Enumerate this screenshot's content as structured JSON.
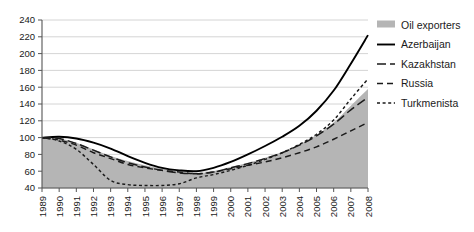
{
  "chart_data": {
    "type": "line",
    "title": "",
    "subtitle": "",
    "xlabel": "",
    "ylabel": "",
    "xlim": [
      1989,
      2008
    ],
    "ylim": [
      40,
      240
    ],
    "ytick_step": 20,
    "grid": true,
    "legend_position": "right",
    "index_base": "1989 = 100",
    "x": [
      1989,
      1990,
      1991,
      1992,
      1993,
      1994,
      1995,
      1996,
      1997,
      1998,
      1999,
      2000,
      2001,
      2002,
      2003,
      2004,
      2005,
      2006,
      2007,
      2008
    ],
    "categories": [
      "1989",
      "1990",
      "1991",
      "1992",
      "1993",
      "1994",
      "1995",
      "1996",
      "1997",
      "1998",
      "1999",
      "2000",
      "2001",
      "2002",
      "2003",
      "2004",
      "2005",
      "2006",
      "2007",
      "2008"
    ],
    "yticks": [
      40,
      60,
      80,
      100,
      120,
      140,
      160,
      180,
      200,
      220,
      240
    ],
    "ytick_labels": [
      "40",
      "60",
      "80",
      "100",
      "120",
      "140",
      "160",
      "180",
      "200",
      "220",
      "240"
    ],
    "series": [
      {
        "name": "Oil exporters",
        "style": "area",
        "color": "#b5b5b5",
        "values": [
          100,
          99,
          94,
          86,
          78,
          72,
          67,
          63,
          60,
          58,
          60,
          65,
          70,
          76,
          83,
          92,
          103,
          118,
          138,
          158
        ]
      },
      {
        "name": "Azerbaijan",
        "style": "solid",
        "color": "#000000",
        "values": [
          100,
          101,
          99,
          94,
          87,
          78,
          70,
          64,
          61,
          60,
          64,
          71,
          80,
          90,
          101,
          114,
          132,
          156,
          188,
          222
        ]
      },
      {
        "name": "Kazakhstan",
        "style": "long-dash",
        "color": "#1a1a1a",
        "values": [
          100,
          99,
          93,
          85,
          77,
          70,
          65,
          61,
          58,
          57,
          59,
          64,
          69,
          75,
          82,
          91,
          102,
          116,
          133,
          148
        ]
      },
      {
        "name": "Russia",
        "style": "medium-dash",
        "color": "#1a1a1a",
        "values": [
          100,
          97,
          91,
          82,
          75,
          68,
          64,
          61,
          59,
          57,
          59,
          63,
          67,
          71,
          76,
          82,
          89,
          98,
          108,
          118
        ]
      },
      {
        "name": "Turkmenista",
        "style": "short-dash",
        "color": "#1a1a1a",
        "values": [
          100,
          96,
          86,
          68,
          49,
          44,
          43,
          43,
          45,
          52,
          56,
          61,
          67,
          74,
          82,
          92,
          104,
          121,
          146,
          170
        ]
      }
    ]
  },
  "legend": {
    "items": [
      {
        "label": "Oil exporters",
        "swatch": "area-swatch"
      },
      {
        "label": "Azerbaijan",
        "swatch": "solid-line-swatch"
      },
      {
        "label": "Kazakhstan",
        "swatch": "long-dash-line-swatch"
      },
      {
        "label": "Russia",
        "swatch": "medium-dash-line-swatch"
      },
      {
        "label": "Turkmenista",
        "swatch": "short-dash-line-swatch"
      }
    ]
  },
  "colors": {
    "area_fill": "#b5b5b5",
    "grid": "#c9c9c9",
    "axis": "#555555",
    "text": "#1a1a1a",
    "background": "#ffffff"
  }
}
